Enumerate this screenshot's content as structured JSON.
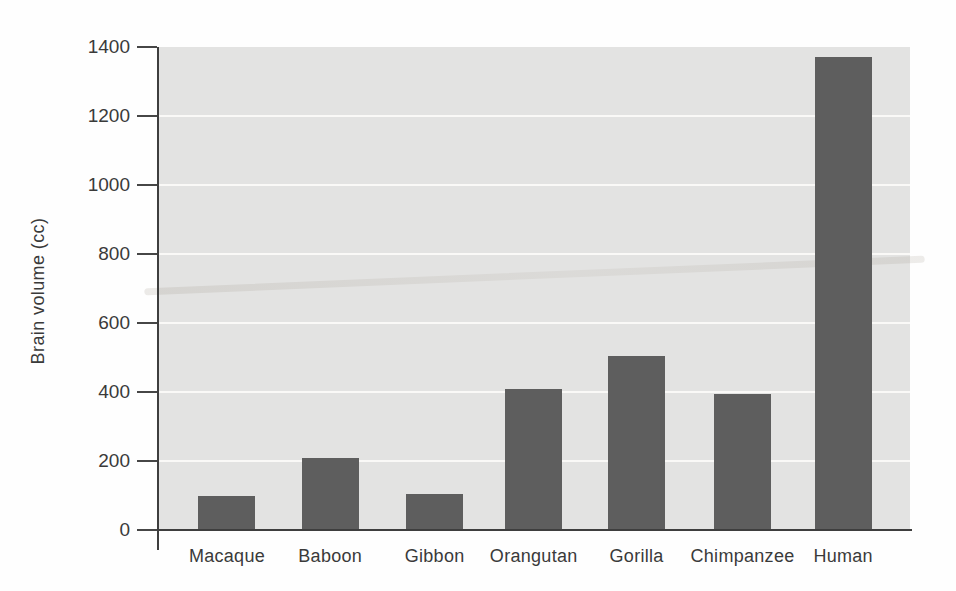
{
  "figure": {
    "ylabel": "Brain volume (cc)",
    "colors": {
      "bar": "#5e5e5e",
      "plot_background": "#e3e3e2",
      "gridline": "#faf9f7",
      "axis": "#3e3e3e",
      "text": "#3a3a3a",
      "page_background": "#fefefe"
    }
  },
  "chart_data": {
    "type": "bar",
    "title": "",
    "xlabel": "",
    "ylabel": "Brain volume (cc)",
    "categories": [
      "Macaque",
      "Baboon",
      "Gibbon",
      "Orangutan",
      "Gorilla",
      "Chimpanzee",
      "Human"
    ],
    "values": [
      100,
      210,
      105,
      410,
      505,
      395,
      1370
    ],
    "ylim": [
      0,
      1400
    ],
    "y_ticks": [
      0,
      200,
      400,
      600,
      800,
      1000,
      1200,
      1400
    ],
    "grid": "horizontal white gridlines at each y tick",
    "legend": "none",
    "layout_hints": {
      "bar_centers_frac": [
        0.0905,
        0.228,
        0.367,
        0.499,
        0.636,
        0.777,
        0.911
      ],
      "bar_width_frac": 0.076
    }
  }
}
